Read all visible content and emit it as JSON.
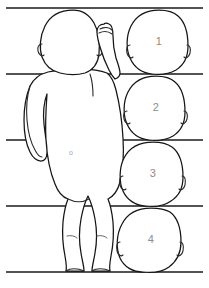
{
  "diagram": {
    "background_color": "#ffffff",
    "line_color": "#151515",
    "reference_line_color": "#1a1a1a",
    "number_color": "#8d8d8d",
    "width": 209,
    "height": 288
  },
  "reference_lines": [
    {
      "id": "line-top",
      "label": "1",
      "y": 8
    },
    {
      "id": "line-2",
      "label": "2",
      "y": 74
    },
    {
      "id": "line-3",
      "label": "3",
      "y": 140
    },
    {
      "id": "line-4",
      "label": "4",
      "y": 206
    },
    {
      "id": "line-bottom",
      "label": "5",
      "y": 272
    }
  ],
  "head_units": [
    {
      "number": "1",
      "cx": 159,
      "cy": 42
    },
    {
      "number": "2",
      "cx": 156,
      "cy": 108
    },
    {
      "number": "3",
      "cx": 153,
      "cy": 174
    },
    {
      "number": "4",
      "cx": 151,
      "cy": 240
    }
  ],
  "body_figure": {
    "name": "infant-back-view",
    "pose": "standing, right arm raised with clenched fist",
    "navel_label": "o"
  }
}
